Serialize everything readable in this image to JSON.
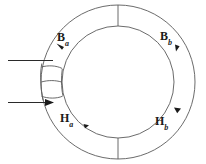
{
  "figure": {
    "background_color": "#ffffff",
    "line_color": "#4a4a4a",
    "label_color": "#1a1a1a",
    "labels": [
      {
        "id": "Ba",
        "symbol": "B",
        "subscript": "a",
        "text": "Ba",
        "quantity": "magnetic-flux-density",
        "region": "outer-left",
        "arrow_direction": "counterclockwise-up-left"
      },
      {
        "id": "Bb",
        "symbol": "B",
        "subscript": "b",
        "text": "Bb",
        "quantity": "magnetic-flux-density",
        "region": "outer-right",
        "arrow_direction": "clockwise-down"
      },
      {
        "id": "Ha",
        "symbol": "H",
        "subscript": "a",
        "text": "Ha",
        "quantity": "magnetic-field-strength",
        "region": "inner-lower-left",
        "arrow_direction": "clockwise-down-right"
      },
      {
        "id": "Hb",
        "symbol": "H",
        "subscript": "b",
        "text": "Hb",
        "quantity": "magnetic-field-strength",
        "region": "inner-lower-right",
        "arrow_direction": "counterclockwise-up-right"
      }
    ],
    "geometry": {
      "center_x": 118,
      "center_y": 82,
      "outer_radius": 77,
      "inner_radius": 56,
      "radial_divider_top_angle_deg": 270,
      "radial_divider_bottom_angle_deg": 90
    },
    "leads": {
      "upper_lead": {
        "has_arrowhead": false,
        "x_start": 8,
        "x_end": 52,
        "y": 60
      },
      "lower_lead": {
        "has_arrowhead": true,
        "x_start": 8,
        "x_end": 52,
        "y": 103
      }
    }
  }
}
